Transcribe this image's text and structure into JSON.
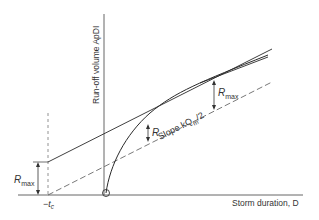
{
  "diagram": {
    "y_axis_label": "Run-off volume ApDI",
    "x_axis_label": "Storm duration, D",
    "labels": {
      "r_max_upper": "R",
      "r_max_upper_sub": "max",
      "r_mid": "R",
      "r_max_left": "R",
      "r_max_left_sub": "max",
      "slope": "Slope kQ",
      "slope_sub": "m",
      "slope_tail": "/2",
      "neg_tc": "−t",
      "neg_tc_sub": "c"
    },
    "colors": {
      "line": "#2a2a2a",
      "dashed": "#555555",
      "background": "#ffffff"
    }
  }
}
